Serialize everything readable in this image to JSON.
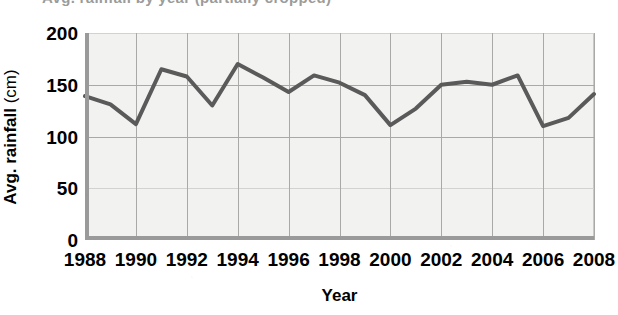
{
  "chart_data": {
    "type": "line",
    "title": "Avg. rainfall by year (partially cropped)",
    "xlabel": "Year",
    "ylabel": "Avg. rainfall (cm)",
    "ylabel_bold_part": "Avg. rainfall",
    "ylabel_unit_part": " (cm)",
    "x": [
      1988,
      1989,
      1990,
      1991,
      1992,
      1993,
      1994,
      1995,
      1996,
      1997,
      1998,
      1999,
      2000,
      2001,
      2002,
      2003,
      2004,
      2005,
      2006,
      2007,
      2008
    ],
    "values": [
      139,
      131,
      112,
      165,
      158,
      130,
      170,
      157,
      143,
      159,
      152,
      140,
      111,
      127,
      150,
      153,
      150,
      159,
      110,
      118,
      141
    ],
    "series": [
      {
        "name": "Avg. rainfall (cm)",
        "values": [
          139,
          131,
          112,
          165,
          158,
          130,
          170,
          157,
          143,
          159,
          152,
          140,
          111,
          127,
          150,
          153,
          150,
          159,
          110,
          118,
          141
        ]
      }
    ],
    "xlim": [
      1988,
      2008
    ],
    "ylim": [
      0,
      200
    ],
    "ytick_labels": [
      "200",
      "150",
      "100",
      "50",
      "0"
    ],
    "ytick_values": [
      200,
      150,
      100,
      50,
      0
    ],
    "xtick_labels": [
      "1988",
      "1990",
      "1992",
      "1994",
      "1996",
      "1998",
      "2000",
      "2002",
      "2004",
      "2006",
      "2008"
    ],
    "xtick_values": [
      1988,
      1990,
      1992,
      1994,
      1996,
      1998,
      2000,
      2002,
      2004,
      2006,
      2008
    ],
    "grid": "both",
    "grid_x_step": 2,
    "grid_y_step": 50,
    "legend": "none",
    "line_color": "#5a5a5a",
    "line_width_px": 4,
    "markers": "none",
    "plot_background": "#f2f2f0",
    "axis_color": "#9a9a9a",
    "grid_color": "#a9a9a7",
    "text_color": "#000000",
    "annotations": []
  }
}
